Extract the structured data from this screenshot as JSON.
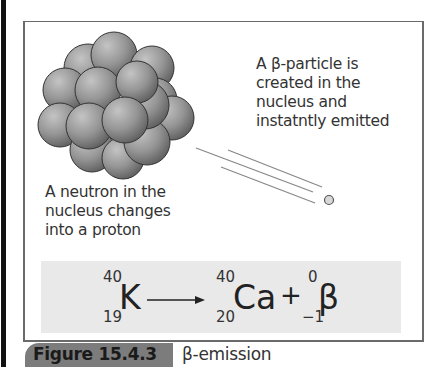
{
  "figure": {
    "label": "Figure 15.4.3",
    "title": "β-emission"
  },
  "annotations": {
    "beta_particle": "A β-particle is created in the nucleus and instatntly emitted",
    "beta_lines": [
      "A β-particle is",
      "created in the",
      "nucleus and",
      "instatntly emitted"
    ],
    "neutron_lines": [
      "A neutron in the",
      "nucleus changes",
      "into a proton"
    ]
  },
  "equation": {
    "reactant": {
      "symbol": "K",
      "mass": "40",
      "atomic": "19"
    },
    "arrow": "⟶",
    "product1": {
      "symbol": "Ca",
      "mass": "40",
      "atomic": "20"
    },
    "plus": "+",
    "product2": {
      "symbol": "β",
      "mass": "0",
      "atomic": "−1"
    }
  },
  "colors": {
    "frame": "#6a6a6a",
    "equation_bg": "#e9e9e9",
    "caption_tab": "#7c7c7c",
    "nucleon": "#8a8a8a"
  }
}
